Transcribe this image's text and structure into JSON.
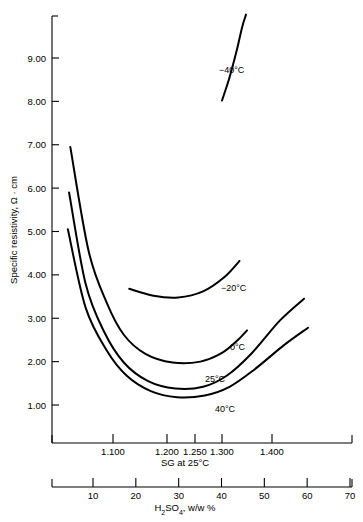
{
  "figure": {
    "background": "#ffffff",
    "ink": "#000000"
  },
  "yaxis": {
    "title": "Specific resistivity, Ω · cm",
    "ticks": [
      "9.00",
      "8.00",
      "7.00",
      "6.00",
      "5.00",
      "4.00",
      "3.00",
      "2.00",
      "1.00"
    ]
  },
  "xaxis_sg": {
    "title": "SG at 25°C",
    "ticks": [
      "1.100",
      "1.200",
      "1.250",
      "1.300",
      "1.400"
    ]
  },
  "xaxis_conc": {
    "title": "H₂SO₄, w/w %",
    "ticks": [
      "10",
      "20",
      "30",
      "40",
      "50",
      "60",
      "70"
    ]
  },
  "curve_labels": {
    "m40": "−40°C",
    "m20": "−20°C",
    "c0": "0°C",
    "c25": "25°C",
    "c40": "40°C"
  },
  "chart_data": {
    "type": "line",
    "title": "",
    "xlabel": "SG at 25°C",
    "ylabel": "Specific resistivity, Ω · cm",
    "x2label": "H₂SO₄, w/w %",
    "grid": false,
    "legend": "inline-curve-labels",
    "ylim": [
      0.0,
      10.0
    ],
    "ytick_values": [
      9.0,
      8.0,
      7.0,
      6.0,
      5.0,
      4.0,
      3.0,
      2.0,
      1.0
    ],
    "xtick_sg_values": [
      1.1,
      1.2,
      1.25,
      1.3,
      1.4
    ],
    "xtick_conc_values": [
      10,
      20,
      30,
      40,
      50,
      60,
      70
    ],
    "note": "Lower SG axis is non-uniform; the H2SO4 w/w % axis is linear and aligned beneath it.",
    "series": [
      {
        "name": "−40°C",
        "label": "−40°C",
        "points_sg_resistivity": [
          [
            1.3,
            8.02
          ],
          [
            1.315,
            8.55
          ],
          [
            1.33,
            9.2
          ],
          [
            1.34,
            9.7
          ],
          [
            1.348,
            10.0
          ]
        ]
      },
      {
        "name": "−20°C",
        "label": "−20°C",
        "points_sg_resistivity": [
          [
            1.13,
            3.68
          ],
          [
            1.175,
            3.52
          ],
          [
            1.22,
            3.48
          ],
          [
            1.265,
            3.62
          ],
          [
            1.305,
            3.95
          ],
          [
            1.335,
            4.32
          ]
        ]
      },
      {
        "name": "0°C",
        "label": "0°C",
        "points_sg_resistivity": [
          [
            1.03,
            6.95
          ],
          [
            1.06,
            4.55
          ],
          [
            1.09,
            3.35
          ],
          [
            1.12,
            2.62
          ],
          [
            1.16,
            2.18
          ],
          [
            1.21,
            1.98
          ],
          [
            1.26,
            2.0
          ],
          [
            1.3,
            2.2
          ],
          [
            1.33,
            2.48
          ],
          [
            1.35,
            2.72
          ]
        ]
      },
      {
        "name": "25°C",
        "label": "25°C",
        "points_sg_resistivity": [
          [
            1.028,
            5.9
          ],
          [
            1.055,
            3.8
          ],
          [
            1.085,
            2.7
          ],
          [
            1.12,
            1.98
          ],
          [
            1.165,
            1.55
          ],
          [
            1.215,
            1.38
          ],
          [
            1.265,
            1.42
          ],
          [
            1.31,
            1.68
          ],
          [
            1.36,
            2.2
          ],
          [
            1.41,
            2.95
          ],
          [
            1.44,
            3.45
          ]
        ]
      },
      {
        "name": "40°C",
        "label": "40°C",
        "points_sg_resistivity": [
          [
            1.026,
            5.05
          ],
          [
            1.055,
            3.25
          ],
          [
            1.09,
            2.25
          ],
          [
            1.125,
            1.68
          ],
          [
            1.17,
            1.32
          ],
          [
            1.218,
            1.18
          ],
          [
            1.268,
            1.22
          ],
          [
            1.315,
            1.42
          ],
          [
            1.365,
            1.82
          ],
          [
            1.415,
            2.38
          ],
          [
            1.445,
            2.78
          ]
        ]
      }
    ]
  }
}
